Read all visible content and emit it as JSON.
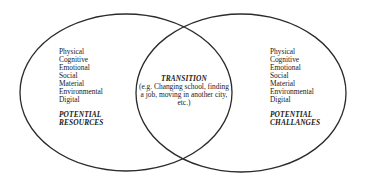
{
  "diagram": {
    "type": "venn",
    "sets": [
      {
        "id": "resources",
        "heading": "POTENTIAL RESOURCES",
        "heading_lines": [
          "POTENTIAL",
          "RESOURCES"
        ],
        "items": [
          "Physical",
          "Cognitive",
          "Emotional",
          "Social",
          "Material",
          "Environmental",
          "Digital"
        ]
      },
      {
        "id": "challenges",
        "heading": "POTENTIAL CHALLANGES",
        "heading_lines": [
          "POTENTIAL",
          "CHALLANGES"
        ],
        "items": [
          "Physical",
          "Cognitive",
          "Emotional",
          "Social",
          "Material",
          "Environmental",
          "Digital"
        ]
      }
    ],
    "intersection": {
      "title": "TRANSITION",
      "description": "(e.g. Changing school, finding a job, moving in another city, etc.)",
      "description_lines": [
        "(e.g. Changing school, finding",
        "a job, moving in another city,",
        "etc.)"
      ]
    },
    "colors": {
      "stroke": "#2b2b2b",
      "text": "#1a1a1a",
      "background": "#ffffff"
    }
  }
}
